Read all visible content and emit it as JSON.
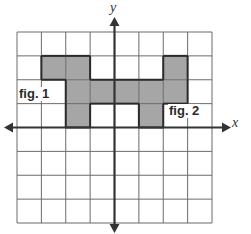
{
  "diagram": {
    "type": "coordinate-grid",
    "grid": {
      "cols": 8,
      "rows": 8,
      "left": 17,
      "top": 32,
      "right": 212,
      "bottom": 223
    },
    "axes": {
      "x_label": "x",
      "y_label": "y",
      "origin_col": 4,
      "origin_row": 4
    },
    "shaded_cells": [
      {
        "row": 1,
        "col": 1
      },
      {
        "row": 1,
        "col": 2
      },
      {
        "row": 1,
        "col": 6
      },
      {
        "row": 2,
        "col": 2
      },
      {
        "row": 2,
        "col": 3
      },
      {
        "row": 2,
        "col": 4
      },
      {
        "row": 2,
        "col": 5
      },
      {
        "row": 2,
        "col": 6
      },
      {
        "row": 3,
        "col": 2
      },
      {
        "row": 3,
        "col": 5
      }
    ],
    "labels": {
      "fig1": "fig. 1",
      "fig2": "fig. 2"
    },
    "colors": {
      "shade": "#a6a6a6",
      "grid_line": "#6b6b6b",
      "axis": "#333333",
      "outline": "#2b2b2b"
    }
  }
}
